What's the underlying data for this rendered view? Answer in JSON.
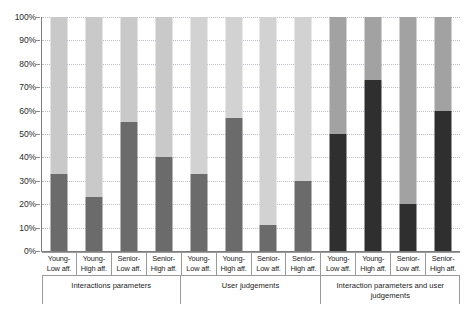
{
  "chart_data": {
    "type": "bar",
    "title": "",
    "subtitle": "",
    "xlabel": "",
    "ylabel": "",
    "stacked": "100%",
    "grid": true,
    "legend_position": "none",
    "ylim": [
      0,
      100
    ],
    "y_ticks": [
      "0%",
      "10%",
      "20%",
      "30%",
      "40%",
      "50%",
      "60%",
      "70%",
      "80%",
      "90%",
      "100%"
    ],
    "y_tick_values": [
      0,
      10,
      20,
      30,
      40,
      50,
      60,
      70,
      80,
      90,
      100
    ],
    "categories": [
      "Young-Low aff.",
      "Young-High aff.",
      "Senior-Low aff.",
      "Senior-High aff.",
      "Young-Low aff.",
      "Young-High aff.",
      "Senior-Low aff.",
      "Senior-High aff.",
      "Young-Low aff.",
      "Young-High aff.",
      "Senior-Low aff.",
      "Senior-High aff."
    ],
    "category_lines": [
      [
        "Young-",
        "Low aff."
      ],
      [
        "Young-",
        "High aff."
      ],
      [
        "Senior-",
        "Low aff."
      ],
      [
        "Senior-",
        "High aff."
      ],
      [
        "Young-",
        "Low aff."
      ],
      [
        "Young-",
        "High aff."
      ],
      [
        "Senior-",
        "Low aff."
      ],
      [
        "Senior-",
        "High aff."
      ],
      [
        "Young-",
        "Low aff."
      ],
      [
        "Young-",
        "High aff."
      ],
      [
        "Senior-",
        "Low aff."
      ],
      [
        "Senior-",
        "High aff."
      ]
    ],
    "groups": [
      {
        "label": "Interactions parameters",
        "span": 4
      },
      {
        "label": "User judgements",
        "span": 4
      },
      {
        "label": "Interaction parameters and user judgements",
        "span": 4
      }
    ],
    "series": [
      {
        "name": "lower-segment",
        "values": [
          33,
          23,
          55,
          40,
          33,
          57,
          11,
          30,
          50,
          73,
          20,
          60
        ]
      },
      {
        "name": "upper-segment",
        "values": [
          67,
          77,
          45,
          60,
          67,
          43,
          89,
          70,
          50,
          27,
          80,
          40
        ]
      }
    ],
    "bar_colors_lower": [
      "#6b6b6b",
      "#6b6b6b",
      "#6b6b6b",
      "#6b6b6b",
      "#6b6b6b",
      "#6b6b6b",
      "#6b6b6b",
      "#6b6b6b",
      "#2f2f2f",
      "#2f2f2f",
      "#2f2f2f",
      "#2f2f2f"
    ],
    "bar_colors_upper": [
      "#c9c9c9",
      "#c9c9c9",
      "#c9c9c9",
      "#c9c9c9",
      "#d2d2d2",
      "#d2d2d2",
      "#d2d2d2",
      "#d2d2d2",
      "#a2a2a2",
      "#a2a2a2",
      "#a2a2a2",
      "#a2a2a2"
    ]
  },
  "colors": {
    "axis": "#7d7d7d",
    "grid": "#b9bfc9",
    "text": "#1c1c1c",
    "background": "#ffffff"
  }
}
